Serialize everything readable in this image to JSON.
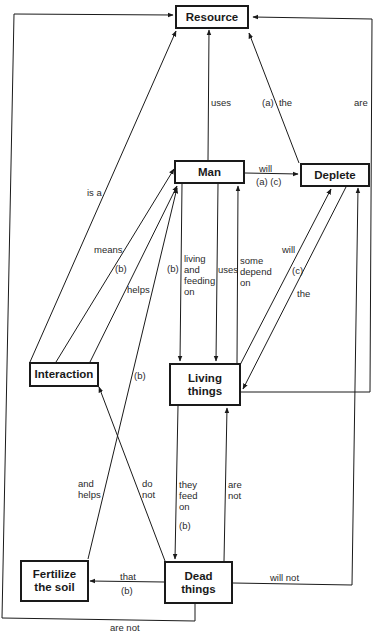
{
  "diagram": {
    "type": "concept-map",
    "nodes": {
      "resource": "Resource",
      "man": "Man",
      "deplete": "Deplete",
      "interaction": "Interaction",
      "living_things": "Living\nthings",
      "fertilize_soil": "Fertilize\nthe soil",
      "dead_things": "Dead\nthings"
    },
    "labels": {
      "uses_top": "uses",
      "a_the": "(a)  the",
      "are": "are",
      "will_man_deplete": "will",
      "a_c": "(a) (c)",
      "is_a": "is a",
      "means": "means",
      "b_means": "(b)",
      "helps": "helps",
      "b_left": "(b)",
      "living_feeding_on": "living\nand\nfeeding\non",
      "uses_mid": "uses",
      "some_depend_on": "some\ndepend\non",
      "will_living_deplete": "will",
      "c": "(c)",
      "the": "the",
      "b_interaction": "(b)",
      "and_helps": "and\nhelps",
      "do_not": "do\nnot",
      "they_feed_on": "they\nfeed\non",
      "b_feed": "(b)",
      "are_not_mid": "are\nnot",
      "that": "that",
      "b_that": "(b)",
      "will_not": "will not",
      "are_not_bottom": "are not"
    },
    "edges": [
      {
        "from": "Man",
        "to": "Resource",
        "label": "uses"
      },
      {
        "from": "Deplete",
        "to": "Resource",
        "label": "(a) the"
      },
      {
        "from": "Living things",
        "to": "Resource",
        "label": "are"
      },
      {
        "from": "Dead things",
        "to": "Resource",
        "label": "are not"
      },
      {
        "from": "Interaction",
        "to": "Resource",
        "label": "is a"
      },
      {
        "from": "Man",
        "to": "Deplete",
        "label": "will (a) (c)"
      },
      {
        "from": "Interaction",
        "to": "Man",
        "label": "means (b)"
      },
      {
        "from": "Interaction",
        "to": "Man",
        "label": "helps"
      },
      {
        "from": "Fertilize the soil",
        "to": "Man",
        "label": "and helps (b)"
      },
      {
        "from": "Man",
        "to": "Living things",
        "label": "(b) living and feeding on"
      },
      {
        "from": "Man",
        "to": "Living things",
        "label": "uses"
      },
      {
        "from": "Living things",
        "to": "Man",
        "label": "some depend on"
      },
      {
        "from": "Living things",
        "to": "Deplete",
        "label": "will"
      },
      {
        "from": "Deplete",
        "to": "Living things",
        "label": "(c) the"
      },
      {
        "from": "Dead things",
        "to": "Interaction",
        "label": "do not"
      },
      {
        "from": "Living things",
        "to": "Dead things",
        "label": "they feed on (b)"
      },
      {
        "from": "Dead things",
        "to": "Living things",
        "label": "are not"
      },
      {
        "from": "Dead things",
        "to": "Fertilize the soil",
        "label": "that (b)"
      },
      {
        "from": "Dead things",
        "to": "Deplete",
        "label": "will not"
      }
    ]
  }
}
